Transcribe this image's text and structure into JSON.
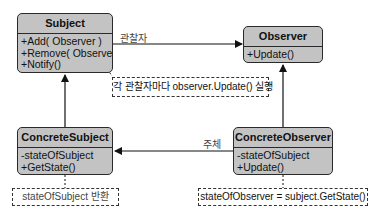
{
  "diagram": {
    "type": "uml-class-diagram",
    "colors": {
      "class_fill": "#c3c3c3",
      "line": "#1a1a1a",
      "note_border": "#333333"
    },
    "classes": {
      "subject": {
        "name": "Subject",
        "members": [
          "+Add( Observer )",
          "+Remove( Observer )",
          "+Notify()"
        ]
      },
      "observer": {
        "name": "Observer",
        "members": [
          "+Update()"
        ]
      },
      "concrete_subject": {
        "name": "ConcreteSubject",
        "members": [
          "-stateOfSubject",
          "+GetState()"
        ]
      },
      "concrete_observer": {
        "name": "ConcreteObserver",
        "members": [
          "-stateOfSubject",
          "+Update()"
        ]
      }
    },
    "relations": {
      "subject_to_observer_label": "관찰자",
      "concrete_observer_to_concrete_subject_label": "주체"
    },
    "notes": {
      "notify_note": "각 관찰자마다 observer.Update() 실행",
      "get_state_note": "stateOfSubject 반환",
      "update_note": "stateOfObserver = subject.GetState()"
    }
  }
}
